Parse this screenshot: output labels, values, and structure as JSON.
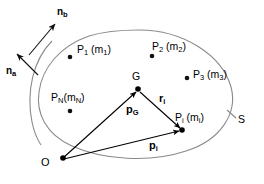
{
  "figure": {
    "surface_label": "S",
    "origin_label": "O",
    "centroid_label": "G",
    "stroke_color": "#8a8a8a",
    "vector_color": "#000000",
    "text_color": "#000000",
    "background": "#ffffff"
  },
  "normals": [
    {
      "name": "n-b",
      "base": "n",
      "sub": "b",
      "x": 57,
      "y": 7
    },
    {
      "name": "n-a",
      "base": "n",
      "sub": "a",
      "x": 6,
      "y": 66
    }
  ],
  "points": [
    {
      "name": "P1",
      "base": "P",
      "sub": "1",
      "mass_base": "m",
      "mass_sub": "1",
      "x": 77,
      "y": 44,
      "dot_x": 70,
      "dot_y": 57
    },
    {
      "name": "P2",
      "base": "P",
      "sub": "2",
      "mass_base": "m",
      "mass_sub": "2",
      "x": 152,
      "y": 41,
      "dot_x": 152,
      "dot_y": 56
    },
    {
      "name": "P3",
      "base": "P",
      "sub": "3",
      "mass_base": "m",
      "mass_sub": "3",
      "x": 193,
      "y": 69,
      "dot_x": 187,
      "dot_y": 78
    },
    {
      "name": "PN",
      "base": "P",
      "sub": "N",
      "mass_base": "m",
      "mass_sub": "N",
      "x": 51,
      "y": 92,
      "dot_x": 70,
      "dot_y": 111
    },
    {
      "name": "Pi",
      "base": "P",
      "sub": "i",
      "mass_base": "m",
      "mass_sub": "i",
      "x": 175,
      "y": 112,
      "dot_x": 182,
      "dot_y": 130
    }
  ],
  "vectors": [
    {
      "name": "p-G",
      "base": "p",
      "sub": "G",
      "x": 126,
      "y": 104,
      "from": "O",
      "to": "G"
    },
    {
      "name": "r-i",
      "base": "r",
      "sub": "i",
      "x": 159,
      "y": 93,
      "from": "G",
      "to": "Pi"
    },
    {
      "name": "p-i",
      "base": "p",
      "sub": "i",
      "x": 149,
      "y": 140,
      "from": "O",
      "to": "Pi"
    }
  ],
  "nodes": {
    "origin": {
      "label": "O",
      "label_x": 41,
      "label_y": 157,
      "dot_x": 63,
      "dot_y": 158
    },
    "centroid": {
      "label": "G",
      "label_x": 132,
      "label_y": 71,
      "dot_x": 138,
      "dot_y": 89
    },
    "surface": {
      "label": "S",
      "label_x": 238,
      "label_y": 114
    }
  }
}
